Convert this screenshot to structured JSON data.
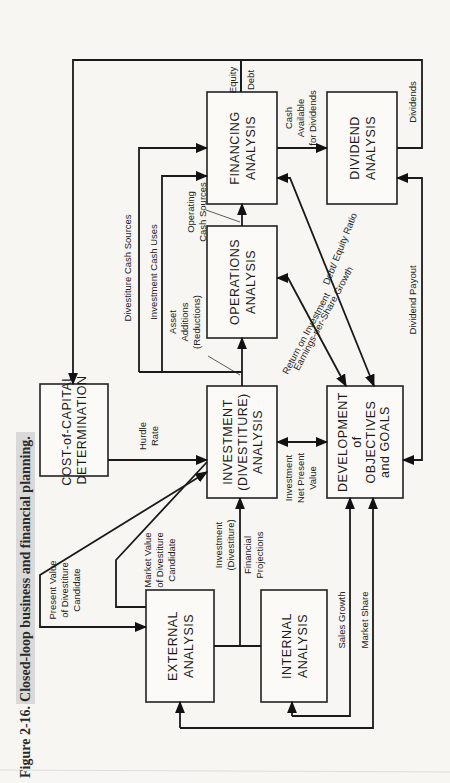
{
  "caption": {
    "figure_number": "Figure 2-16.",
    "title": "Closed-loop business and financial planning."
  },
  "boxes": {
    "cost_of_capital": [
      "COST-of-CAPITAL",
      "DETERMINATION"
    ],
    "investment": [
      "INVESTMENT",
      "(DIVESTITURE)",
      "ANALYSIS"
    ],
    "development": [
      "DEVELOPMENT",
      "of",
      "OBJECTIVES",
      "and GOALS"
    ],
    "operations": [
      "OPERATIONS",
      "ANALYSIS"
    ],
    "financing": [
      "FINANCING",
      "ANALYSIS"
    ],
    "dividend": [
      "DIVIDEND",
      "ANALYSIS"
    ],
    "external": [
      "EXTERNAL",
      "ANALYSIS"
    ],
    "internal": [
      "INTERNAL",
      "ANALYSIS"
    ]
  },
  "flows": {
    "present_value": [
      "Present Value",
      "of Divestiture",
      "Candidate"
    ],
    "market_value": [
      "Market Value",
      "of Divestiture",
      "Candidate"
    ],
    "hurdle_rate": [
      "Hurdle",
      "Rate"
    ],
    "investment_divestiture": [
      "Investment",
      "(Divestiture)"
    ],
    "financial_projections": [
      "Financial",
      "Projections"
    ],
    "investment_npv": [
      "Investment",
      "Net Present",
      "Value"
    ],
    "sales_growth": "Sales Growth",
    "market_share": "Market Share",
    "divestiture_cash_sources": "Divestiture Cash Sources",
    "investment_cash_uses": "Investment Cash Uses",
    "asset_additions": [
      "Asset",
      "Additions",
      "(Reductions)"
    ],
    "operating_cash_sources": [
      "Operating",
      "Cash Sources"
    ],
    "return_on_investment": "Return on Investment",
    "eps_growth": "Earnings-per-Share Growth",
    "debt_equity_ratio": "Debt/ Equity Ratio",
    "dividend_payout": "Dividend Payout",
    "equity": "Equity",
    "debt": "Debt",
    "cash_available": [
      "Cash",
      "Available",
      "for Dividends"
    ],
    "dividends": "Dividends"
  }
}
